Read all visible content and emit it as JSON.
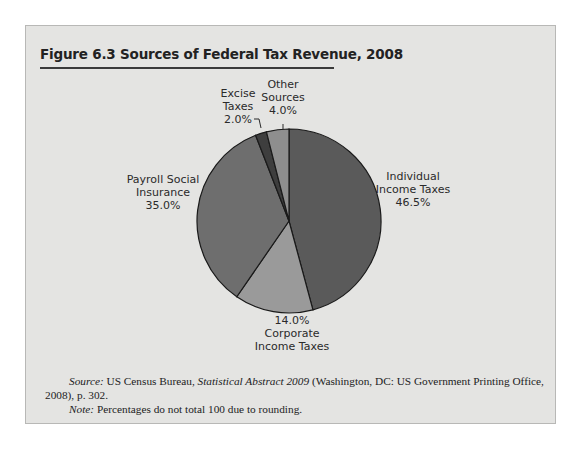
{
  "figure": {
    "title": "Figure 6.3  Sources of Federal Tax Revenue, 2008",
    "source_label": "Source:",
    "source_text_1": " US Census Bureau, ",
    "source_title": "Statistical Abstract 2009",
    "source_text_2": " (Washington, DC: US Government Printing Office, 2008), p. 302.",
    "note_label": "Note:",
    "note_text": " Percentages do not total 100 due to rounding."
  },
  "chart_data": {
    "type": "pie",
    "title": "Sources of Federal Tax Revenue, 2008",
    "units": "percent",
    "slices": [
      {
        "name": "Individual Income Taxes",
        "value": 46.5,
        "label_lines": [
          "Individual",
          "Income Taxes",
          "46.5%"
        ],
        "color": "#5a5a5a"
      },
      {
        "name": "Corporate Income Taxes",
        "value": 14.0,
        "label_lines": [
          "14.0%",
          "Corporate",
          "Income Taxes"
        ],
        "color": "#9a9a9a"
      },
      {
        "name": "Payroll Social Insurance",
        "value": 35.0,
        "label_lines": [
          "Payroll Social",
          "Insurance",
          "35.0%"
        ],
        "color": "#6e6e6e"
      },
      {
        "name": "Excise Taxes",
        "value": 2.0,
        "label_lines": [
          "Excise",
          "Taxes",
          "2.0%"
        ],
        "color": "#3e3e3e"
      },
      {
        "name": "Other Sources",
        "value": 4.0,
        "label_lines": [
          "Other",
          "Sources",
          "4.0%"
        ],
        "color": "#8e8e8e"
      }
    ],
    "start_angle": "12 o'clock",
    "direction": "clockwise",
    "note": "Percentages do not total 100 due to rounding."
  }
}
